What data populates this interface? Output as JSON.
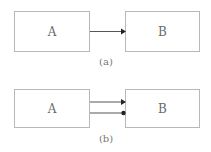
{
  "diagrams": [
    {
      "caption": "(a)",
      "left_box": {
        "label": "A"
      },
      "right_box": {
        "label": "B"
      },
      "connections": [
        {
          "type": "arrow",
          "head": "triangle"
        }
      ]
    },
    {
      "caption": "(b)",
      "left_box": {
        "label": "A"
      },
      "right_box": {
        "label": "B"
      },
      "connections": [
        {
          "type": "arrow",
          "head": "triangle"
        },
        {
          "type": "arrow",
          "head": "dot"
        }
      ]
    }
  ],
  "colors": {
    "box_border": "#b8b8b8",
    "line": "#555555",
    "text": "#6a6a6a"
  }
}
